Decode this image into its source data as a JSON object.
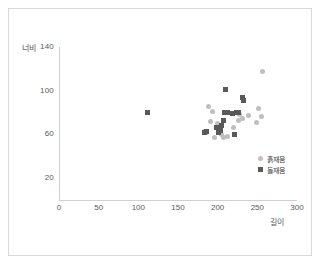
{
  "chart_data": {
    "type": "scatter",
    "title": "",
    "xlabel": "길이",
    "ylabel": "너비",
    "xlim": [
      0,
      300
    ],
    "ylim": [
      0,
      140
    ],
    "xticks": [
      0,
      50,
      100,
      150,
      200,
      250,
      300
    ],
    "yticks": [
      20,
      60,
      100,
      140
    ],
    "grid": false,
    "legend_position": "bottom-right",
    "series": [
      {
        "name": "흙재움",
        "marker": "circle",
        "color": "#bfbfbf",
        "points": [
          [
            257,
            118
          ],
          [
            252,
            84
          ],
          [
            255,
            76
          ],
          [
            249,
            71
          ],
          [
            239,
            77
          ],
          [
            231,
            75
          ],
          [
            228,
            78
          ],
          [
            226,
            73
          ],
          [
            220,
            66
          ],
          [
            213,
            58
          ],
          [
            207,
            57
          ],
          [
            205,
            60
          ],
          [
            203,
            66
          ],
          [
            200,
            70
          ],
          [
            196,
            57
          ],
          [
            193,
            81
          ],
          [
            191,
            72
          ],
          [
            189,
            86
          ],
          [
            186,
            62
          ],
          [
            184,
            63
          ]
        ]
      },
      {
        "name": "돌재움",
        "marker": "square",
        "color": "#595959",
        "points": [
          [
            111,
            80
          ],
          [
            210,
            101
          ],
          [
            231,
            94
          ],
          [
            232,
            91
          ],
          [
            226,
            80
          ],
          [
            224,
            80
          ],
          [
            221,
            60
          ],
          [
            219,
            79
          ],
          [
            212,
            80
          ],
          [
            209,
            80
          ],
          [
            207,
            73
          ],
          [
            205,
            68
          ],
          [
            203,
            64
          ],
          [
            201,
            62
          ],
          [
            199,
            66
          ],
          [
            186,
            63
          ],
          [
            184,
            62
          ]
        ]
      }
    ]
  },
  "axes": {
    "y_title": "너비",
    "x_title": "길이",
    "y_tick_labels": [
      "140",
      "100",
      "60",
      "20"
    ],
    "x_tick_labels": [
      "0",
      "50",
      "100",
      "150",
      "200",
      "250",
      "300"
    ]
  },
  "legend": {
    "items": [
      {
        "label": "흙재움",
        "marker": "circle"
      },
      {
        "label": "돌재움",
        "marker": "square"
      }
    ]
  }
}
